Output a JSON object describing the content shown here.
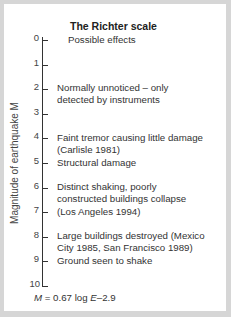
{
  "title": "The Richter scale",
  "column_header": "Possible effects",
  "y_axis": {
    "label": "Magnitude of earthquake M",
    "ticks": [
      "0",
      "1",
      "2",
      "3",
      "4",
      "5",
      "6",
      "7",
      "8",
      "9",
      "10"
    ],
    "range": [
      0,
      10
    ]
  },
  "effects": [
    {
      "magnitude": 2,
      "lines": [
        "Normally unnoticed – only",
        "detected by instruments"
      ]
    },
    {
      "magnitude": 4,
      "lines": [
        "Faint tremor causing little damage",
        "(Carlisle 1981)"
      ]
    },
    {
      "magnitude": 5,
      "lines": [
        "Structural damage"
      ]
    },
    {
      "magnitude": 6,
      "lines": [
        "Distinct shaking, poorly",
        "constructed buildings collapse",
        "(Los Angeles 1994)"
      ]
    },
    {
      "magnitude": 8,
      "lines": [
        "Large buildings destroyed (Mexico",
        "City 1985, San Francisco 1989)"
      ]
    },
    {
      "magnitude": 9,
      "lines": [
        "Ground seen to shake"
      ]
    }
  ],
  "formula": {
    "lhs": "M",
    "eq": " = 0.67 log ",
    "var": "E",
    "rest": "–2.9"
  },
  "colors": {
    "frame": "#d6d6d6",
    "panel": "#ffffff",
    "text": "#333333"
  }
}
